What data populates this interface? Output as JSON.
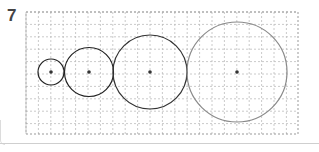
{
  "problem": {
    "number": "7"
  },
  "grid": {
    "left": 26,
    "top": 12,
    "right": 298,
    "bottom": 134,
    "spacing": 12.4,
    "line_color": "#bdbdbd"
  },
  "circles": [
    {
      "cx": 51,
      "cy": 72,
      "r": 13,
      "stroke": "#222222"
    },
    {
      "cx": 89,
      "cy": 72,
      "r": 24.5,
      "stroke": "#222222"
    },
    {
      "cx": 150,
      "cy": 72,
      "r": 37,
      "stroke": "#333333"
    },
    {
      "cx": 237,
      "cy": 72,
      "r": 50,
      "stroke": "#8a8a8a"
    }
  ]
}
